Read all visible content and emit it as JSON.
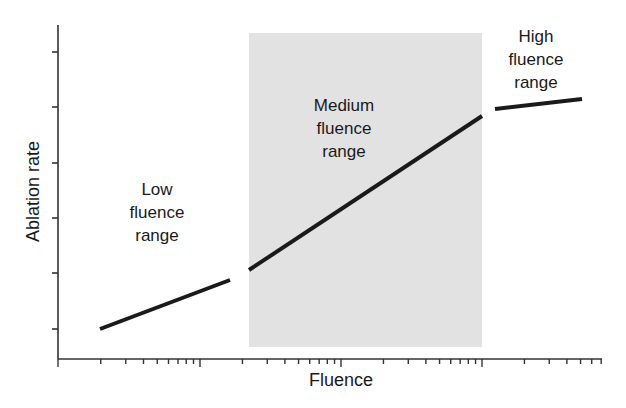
{
  "chart_data": {
    "type": "line",
    "title": "",
    "xlabel": "Fluence",
    "ylabel": "Ablation rate",
    "x_scale": "log",
    "x_axis_ticks_labeled": false,
    "y_axis_ticks_labeled": false,
    "grid": false,
    "legend": null,
    "shaded_region": {
      "label": "Medium fluence range",
      "x_start_px": 249,
      "x_end_px": 482,
      "color": "#e2e2e2"
    },
    "series": [
      {
        "name": "Low fluence range",
        "x_px": [
          100,
          230
        ],
        "y_px": [
          329,
          280
        ]
      },
      {
        "name": "Medium fluence range",
        "x_px": [
          249,
          482
        ],
        "y_px": [
          270,
          116
        ]
      },
      {
        "name": "High fluence range",
        "x_px": [
          495,
          582
        ],
        "y_px": [
          109,
          99
        ]
      }
    ],
    "annotations": [
      {
        "text": "Low\nfluence\nrange",
        "x_px": 157,
        "y_px": 214
      },
      {
        "text": "Medium\nfluence\nrange",
        "x_px": 344,
        "y_px": 130
      },
      {
        "text": "High\nfluence\nrange",
        "x_px": 536,
        "y_px": 61
      }
    ]
  },
  "axes": {
    "x_label": "Fluence",
    "y_label": "Ablation rate"
  },
  "labels": {
    "low": "Low\nfluence\nrange",
    "medium": "Medium\nfluence\nrange",
    "high": "High\nfluence\nrange"
  },
  "colors": {
    "line": "#1a1a1a",
    "axis": "#333333",
    "shade": "#e2e2e2",
    "text": "#1a1a1a"
  }
}
